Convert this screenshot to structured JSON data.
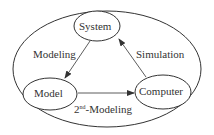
{
  "diagram": {
    "nodes": [
      {
        "id": "system",
        "label": "System"
      },
      {
        "id": "model",
        "label": "Model"
      },
      {
        "id": "computer",
        "label": "Computer"
      }
    ],
    "edges": [
      {
        "from": "system",
        "to": "model",
        "label": "Modeling"
      },
      {
        "from": "computer",
        "to": "system",
        "label": "Simulation"
      },
      {
        "from": "model",
        "to": "computer",
        "label_base": "2",
        "label_sup": "nd",
        "label_rest": "-Modeling"
      }
    ],
    "colors": {
      "stroke": "#333333",
      "background": "#ffffff"
    }
  }
}
